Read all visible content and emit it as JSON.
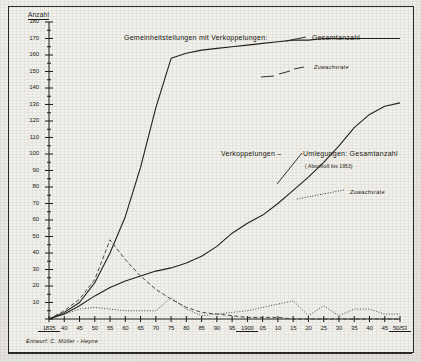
{
  "figure": {
    "y_axis_title": "Anzahl",
    "credit": "Entwurf: C. Müller - Heyne"
  },
  "annotations": {
    "gemeinheitsteilungen": "Gemeinheitsteilungen mit Verkoppelungen:",
    "gesamtanzahl_top": "Gesamtanzahl",
    "zuwachsrate_top": "Zuwachsrate",
    "verkoppelungen": "Verkoppelungen  –",
    "umlegungen": "Umlegungen: Gesamtanzahl",
    "umlegungen_sub": "( Abschluß  bis  1953)",
    "zuwachsrate_bottom": "Zuwachsrate"
  },
  "chart_data": {
    "type": "line",
    "xlabel": "",
    "ylabel": "Anzahl",
    "ylim": [
      0,
      180
    ],
    "ytick_step": 10,
    "yticks": [
      0,
      10,
      20,
      30,
      40,
      50,
      60,
      70,
      80,
      90,
      100,
      110,
      120,
      130,
      140,
      150,
      160,
      170,
      180
    ],
    "xticks": [
      "1835",
      "40",
      "45",
      "50",
      "55",
      "60",
      "65",
      "70",
      "75",
      "80",
      "85",
      "90",
      "95",
      "1900",
      "05",
      "10",
      "15",
      "20",
      "25",
      "30",
      "35",
      "40",
      "45",
      "50/53"
    ],
    "xtick_underlined": [
      "1835",
      "1900",
      "50/53"
    ],
    "grid": false,
    "legend_position": "inline-annotations",
    "series": [
      {
        "name": "Gemeinheitsteilungen mit Verkoppelungen: Gesamtanzahl",
        "style": "solid",
        "x": [
          "1835",
          "40",
          "45",
          "50",
          "55",
          "60",
          "65",
          "70",
          "75",
          "80",
          "85",
          "90",
          "95",
          "1900",
          "05",
          "10",
          "15",
          "20",
          "25",
          "30",
          "35",
          "40",
          "45",
          "50/53"
        ],
        "values": [
          0,
          4,
          10,
          22,
          40,
          62,
          92,
          128,
          158,
          161,
          163,
          164,
          165,
          166,
          167,
          168,
          169,
          169,
          170,
          170,
          170,
          170,
          170,
          170
        ]
      },
      {
        "name": "Gemeinheitsteilungen mit Verkoppelungen: Zuwachsrate",
        "style": "dashed",
        "x": [
          "1835",
          "40",
          "45",
          "50",
          "55",
          "60",
          "65",
          "70",
          "75",
          "80",
          "85",
          "90",
          "95",
          "1900",
          "05",
          "10",
          "15",
          "20",
          "25",
          "30",
          "35",
          "40",
          "45",
          "50/53"
        ],
        "values": [
          0,
          5,
          12,
          24,
          48,
          36,
          26,
          18,
          12,
          7,
          4,
          3,
          2,
          1,
          1,
          1,
          0,
          0,
          0,
          0,
          0,
          0,
          0,
          0
        ]
      },
      {
        "name": "Verkoppelungen / Umlegungen: Gesamtanzahl (Abschluß bis 1953)",
        "style": "solid",
        "x": [
          "1835",
          "40",
          "45",
          "50",
          "55",
          "60",
          "65",
          "70",
          "75",
          "80",
          "85",
          "90",
          "95",
          "1900",
          "05",
          "10",
          "15",
          "20",
          "25",
          "30",
          "35",
          "40",
          "45",
          "50/53"
        ],
        "values": [
          0,
          3,
          8,
          14,
          19,
          23,
          26,
          29,
          31,
          34,
          38,
          44,
          52,
          58,
          63,
          70,
          78,
          86,
          95,
          105,
          116,
          124,
          129,
          131
        ]
      },
      {
        "name": "Umlegungen: Zuwachsrate",
        "style": "dotted",
        "x": [
          "1835",
          "40",
          "45",
          "50",
          "55",
          "60",
          "65",
          "70",
          "75",
          "80",
          "85",
          "90",
          "95",
          "1900",
          "05",
          "10",
          "15",
          "20",
          "25",
          "30",
          "35",
          "40",
          "45",
          "50/53"
        ],
        "values": [
          0,
          3,
          6,
          7,
          6,
          5,
          5,
          5,
          13,
          6,
          2,
          3,
          4,
          5,
          7,
          9,
          11,
          2,
          8,
          2,
          6,
          6,
          3,
          3
        ]
      }
    ]
  }
}
